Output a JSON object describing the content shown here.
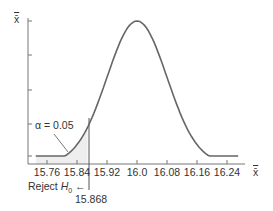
{
  "chart_data": {
    "type": "area",
    "title": "",
    "xlabel": "x̄",
    "ylabel": "x̄",
    "x_ticks": [
      "15.76",
      "15.84",
      "15.92",
      "16.0",
      "16.08",
      "16.16",
      "16.24"
    ],
    "x_tick_values": [
      15.76,
      15.84,
      15.92,
      16.0,
      16.08,
      16.16,
      16.24
    ],
    "xlim": [
      15.72,
      16.28
    ],
    "mean": 16.0,
    "std_error": 0.08,
    "critical_value": 15.868,
    "critical_label": "15.868",
    "alpha": 0.05,
    "alpha_label": "α = 0.05",
    "reject_label_prefix": "Reject ",
    "reject_label_h": "H",
    "reject_label_sub": "0",
    "reject_arrow": "←",
    "shaded_region": "left tail, x̄ < 15.868",
    "grid": false,
    "legend": "none",
    "colors": {
      "curve": "#666666",
      "axis": "#777777",
      "shade": "#eeeeee",
      "text": "#333333"
    }
  }
}
